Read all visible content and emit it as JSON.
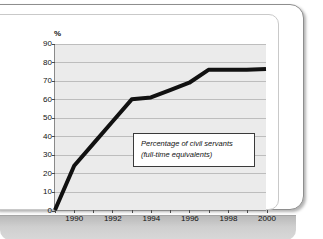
{
  "chart_data": {
    "type": "line",
    "title": "",
    "subtitle": "",
    "xlabel": "",
    "ylabel": "%",
    "ylim": [
      0,
      90
    ],
    "xlim": [
      1989,
      2000
    ],
    "ytick_step": 10,
    "yticks": [
      "0",
      "10",
      "20",
      "30",
      "40",
      "50",
      "60",
      "70",
      "80",
      "90"
    ],
    "xticks": [
      "1990",
      "1992",
      "1994",
      "1996",
      "1998",
      "2000"
    ],
    "xtick_minor_years": [
      1989,
      1991,
      1993,
      1995,
      1997,
      1999
    ],
    "grid": "horizontal",
    "legend": "none",
    "annotations": [
      {
        "line1": "Percentage of civil servants",
        "line2": "(full-time equivalents)"
      }
    ],
    "series": [
      {
        "name": "Percentage of civil servants (full-time equivalents)",
        "color": "#111111",
        "x": [
          1989,
          1990,
          1991,
          1992,
          1993,
          1994,
          1995,
          1996,
          1997,
          1998,
          1999,
          2000
        ],
        "values": [
          0,
          24,
          36,
          48,
          60,
          61,
          65,
          69,
          76,
          76,
          76,
          76.5
        ]
      }
    ]
  },
  "frame": {
    "card_border_color": "#8e8e8e",
    "inner_border_color": "#c9c9c9",
    "band_color": "#cfcfcf"
  },
  "plot_style": {
    "background": "#ebebeb",
    "gridline_color": "#bdbdbd",
    "axis_color": "#8a8a8a",
    "line_color": "#111111"
  }
}
